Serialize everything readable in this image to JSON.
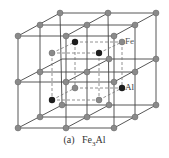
{
  "figure": {
    "caption_prefix": "(a)",
    "caption_formula_base": "Fe",
    "caption_formula_sub": "3",
    "caption_formula_rest": "Al",
    "labels": {
      "fe": "Fe",
      "al": "Al"
    },
    "colors": {
      "lattice_line": "#444444",
      "dashed_line": "#777777",
      "fe_atom": "#8a8a8a",
      "al_atom": "#1e1e1e",
      "background": "#ffffff"
    },
    "structure": "D0_3 superlattice, 2x2x2 cubic cells with body-centered Fe/Al sublattice"
  }
}
